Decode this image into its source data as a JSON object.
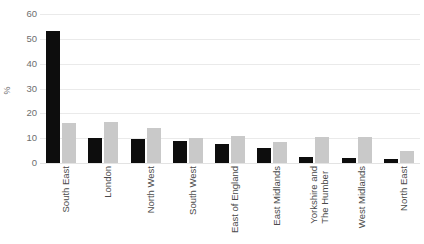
{
  "chart_data": {
    "type": "bar",
    "title": "",
    "subtitle": "",
    "xlabel": "",
    "ylabel": "%",
    "ylim": [
      0,
      60
    ],
    "yticks": [
      0,
      10,
      20,
      30,
      40,
      50,
      60
    ],
    "ytick_labels": [
      "0",
      "10",
      "20",
      "30",
      "40",
      "50",
      "60"
    ],
    "grid": true,
    "legend": false,
    "legend_position": "none",
    "categories": [
      "South East",
      "London",
      "North West",
      "South West",
      "East of England",
      "East Midlands",
      "Yorkshire and The Humber",
      "West Midlands",
      "North East"
    ],
    "category_lines": [
      [
        "South East"
      ],
      [
        "London"
      ],
      [
        "North West"
      ],
      [
        "South West"
      ],
      [
        "East of England"
      ],
      [
        "East Midlands"
      ],
      [
        "Yorkshire and",
        "The Humber"
      ],
      [
        "West Midlands"
      ],
      [
        "North East"
      ]
    ],
    "series": [
      {
        "name": "series-1",
        "color": "#0d0d0d",
        "values": [
          53,
          10,
          9.5,
          9,
          7.5,
          6,
          2.5,
          2,
          1.5
        ]
      },
      {
        "name": "series-2",
        "color": "#c9c9c9",
        "values": [
          16,
          16.5,
          14,
          10,
          11,
          8.5,
          10.5,
          10.5,
          5
        ]
      }
    ]
  },
  "colors": {
    "background": "#ffffff",
    "gridline": "#eaeaea",
    "axis_text": "#6e6e6e",
    "category_text": "#4a4a4a",
    "series_1": "#0d0d0d",
    "series_2": "#c9c9c9"
  }
}
